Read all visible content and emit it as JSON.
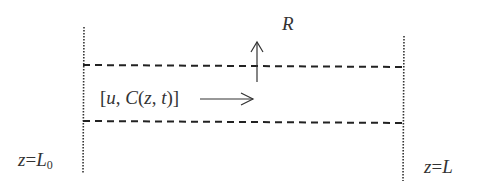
{
  "diagram": {
    "type": "flow-tube-schematic",
    "labels": {
      "radial": "R",
      "flow_state": {
        "open": "[",
        "u": "u",
        "comma1": ", ",
        "C": "C",
        "paren_open": "(",
        "z": "z",
        "comma2": ", ",
        "t": "t",
        "paren_close": ")",
        "close": "]"
      },
      "inlet": {
        "var": "z",
        "eq": "=",
        "L": "L",
        "sub": "0"
      },
      "outlet": {
        "var": "z",
        "eq": "=",
        "L": "L"
      }
    },
    "elements": {
      "left_boundary": "dotted vertical line at inlet",
      "right_boundary": "dotted vertical line at outlet",
      "upper_wall": "dashed horizontal line",
      "lower_wall": "dashed horizontal line",
      "flow_arrow": "rightward arrow",
      "radial_arrow": "upward arrow"
    },
    "colors": {
      "line": "#222222",
      "text": "#333333",
      "background": "#ffffff"
    }
  }
}
